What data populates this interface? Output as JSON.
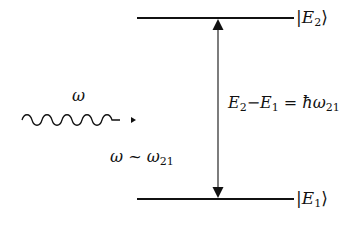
{
  "diagram": {
    "type": "energy-level-diagram",
    "levels": [
      {
        "id": "E2",
        "state_symbol": "E",
        "state_subscript": "2",
        "ket_left": "|",
        "ket_right": "⟩",
        "y": 18
      },
      {
        "id": "E1",
        "state_symbol": "E",
        "state_subscript": "1",
        "ket_left": "|",
        "ket_right": "⟩",
        "y": 199
      }
    ],
    "transition_arrow": {
      "direction": "bidirectional",
      "from": "E1",
      "to": "E2"
    },
    "energy_relation": {
      "lhs_a": "E",
      "lhs_a_sub": "2",
      "minus": "−",
      "lhs_b": "E",
      "lhs_b_sub": "1",
      "equals": " = ",
      "hbar": "ħ",
      "omega": "ω",
      "omega_sub": "21"
    },
    "photon": {
      "label": "ω",
      "icon": "wavy-arrow-icon"
    },
    "resonance_condition": {
      "omega": "ω",
      "approx": " ~ ",
      "omega21": "ω",
      "omega21_sub": "21"
    },
    "colors": {
      "stroke": "#111111",
      "background": "#ffffff"
    }
  }
}
